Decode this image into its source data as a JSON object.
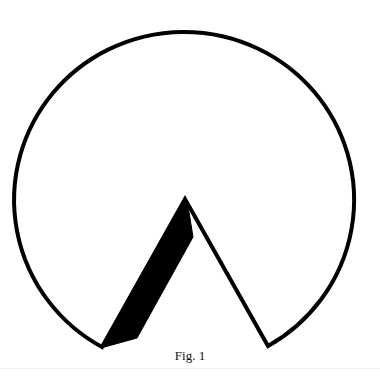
{
  "figure": {
    "caption": "Fig. 1",
    "stroke_color": "#000000",
    "fill_color": "#000000",
    "background": "#ffffff",
    "shape": "circle-with-wedge-cutout",
    "elements": {
      "outline": "circle arc with a triangular notch cut from the bottom",
      "wedge": "black filled sliver along the left side of the notch"
    }
  }
}
